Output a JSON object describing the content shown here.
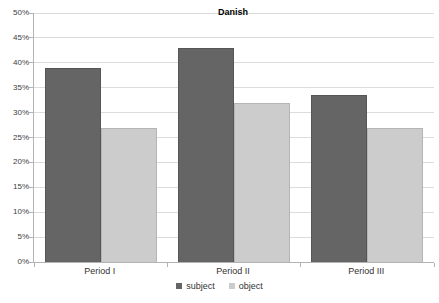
{
  "chart_data": {
    "type": "bar",
    "title": "Danish",
    "categories": [
      "Period I",
      "Period II",
      "Period III"
    ],
    "series": [
      {
        "name": "subject",
        "color": "#656565",
        "border": "#565656",
        "values": [
          39,
          43,
          33.5
        ]
      },
      {
        "name": "object",
        "color": "#cccccc",
        "border": "#b5b5b5",
        "values": [
          27,
          32,
          27
        ]
      }
    ],
    "xlabel": "",
    "ylabel": "",
    "ylim": [
      0,
      50
    ],
    "ytick_step": 5,
    "yticks": [
      "0%",
      "5%",
      "10%",
      "15%",
      "20%",
      "25%",
      "30%",
      "35%",
      "40%",
      "45%",
      "50%"
    ],
    "grid": true,
    "legend_position": "bottom"
  },
  "colors": {
    "background": "#ffffff",
    "gridline": "#dcdcdc",
    "axis": "#b3b3b3",
    "tick_label": "#404040",
    "title": "#000000"
  }
}
